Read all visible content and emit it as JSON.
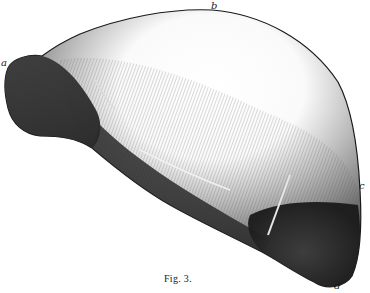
{
  "figure": {
    "caption": "Fig. 3.",
    "labels": [
      {
        "id": "a",
        "text": "a",
        "x": 1,
        "y": 58
      },
      {
        "id": "b",
        "text": "b",
        "x": 211,
        "y": 1
      },
      {
        "id": "c",
        "text": "c",
        "x": 359,
        "y": 181
      },
      {
        "id": "d",
        "text": "d",
        "x": 334,
        "y": 281
      }
    ],
    "colors": {
      "ink": "#1a1a1a",
      "dark_shade": "#2a2a2a",
      "mid_shade": "#6b6b6b",
      "light_shade": "#bdbdbd",
      "paper": "#ffffff"
    }
  }
}
